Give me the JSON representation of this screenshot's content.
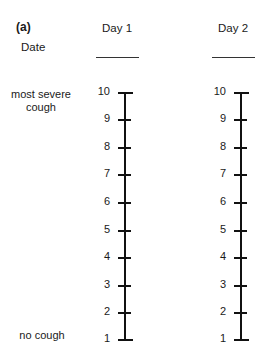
{
  "panel_label": "(a)",
  "date_label": "Date",
  "anchors": {
    "top": "most severe\ncough",
    "bottom": "no cough"
  },
  "days": [
    {
      "label": "Day 1",
      "axis_x": 124,
      "date_line_x": 96,
      "num_x": 96
    },
    {
      "label": "Day 2",
      "axis_x": 240,
      "date_line_x": 212,
      "num_x": 212
    }
  ],
  "scale": {
    "values": [
      "10",
      "9",
      "8",
      "7",
      "6",
      "5",
      "4",
      "3",
      "2",
      "1"
    ],
    "y_positions": [
      92,
      119,
      147,
      174,
      202,
      230,
      257,
      285,
      312,
      339
    ]
  }
}
